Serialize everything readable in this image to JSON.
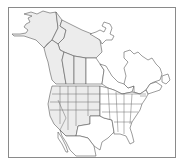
{
  "map": {
    "title": "North America range map",
    "region_label": "North America",
    "colors": {
      "frame": "#8a8a8a",
      "outline": "#5a5a5a",
      "range_fill": "#ececec",
      "background": "#ffffff"
    },
    "shaded_regions": [
      "Alaska",
      "Yukon",
      "Northwest Territories",
      "British Columbia",
      "Alberta",
      "Saskatchewan",
      "Western United States"
    ],
    "unshaded_regions": [
      "Nunavut",
      "Manitoba",
      "Ontario",
      "Quebec",
      "Atlantic Canada",
      "Eastern United States",
      "Texas",
      "Mexico"
    ]
  }
}
